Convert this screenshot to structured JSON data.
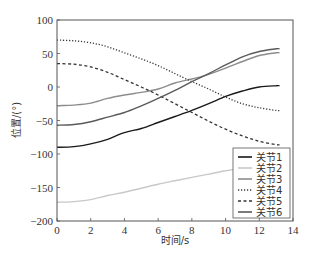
{
  "chart_data": {
    "type": "line",
    "title": "",
    "xlabel": "时间/s",
    "ylabel": "位置/(°)",
    "xlim": [
      0,
      14
    ],
    "ylim": [
      -200,
      100
    ],
    "xticks": [
      0,
      2,
      4,
      6,
      8,
      10,
      12,
      14
    ],
    "yticks": [
      100,
      50,
      0,
      -50,
      -100,
      -150,
      -200
    ],
    "grid": false,
    "legend_position": "lower right",
    "series": [
      {
        "name": "关节1",
        "style": "solid",
        "color": "#1a1a1a",
        "x": [
          0,
          1,
          2,
          3,
          4,
          5,
          6,
          7,
          8,
          9,
          10,
          11,
          12,
          13,
          13.2
        ],
        "values": [
          -90,
          -89,
          -85,
          -78,
          -68,
          -62,
          -53,
          -44,
          -35,
          -25,
          -14,
          -6,
          0,
          2,
          2
        ]
      },
      {
        "name": "关节2",
        "style": "solid",
        "color": "#c8c8c8",
        "x": [
          0,
          1,
          2,
          3,
          4,
          5,
          6,
          7,
          8,
          9,
          10,
          10.5
        ],
        "values": [
          -172,
          -171,
          -168,
          -162,
          -157,
          -151,
          -145,
          -140,
          -135,
          -130,
          -125,
          -123
        ]
      },
      {
        "name": "关节3",
        "style": "solid",
        "color": "#8c8c8c",
        "x": [
          0,
          1,
          2,
          3,
          4,
          5,
          6,
          7,
          8,
          9,
          10,
          11,
          12,
          13,
          13.2
        ],
        "values": [
          -28,
          -27,
          -24,
          -17,
          -12,
          -8,
          -3,
          6,
          12,
          19,
          28,
          38,
          47,
          51,
          51
        ]
      },
      {
        "name": "关节4",
        "style": "dotted",
        "color": "#333333",
        "x": [
          0,
          1,
          2,
          3,
          4,
          5,
          6,
          7,
          8,
          9,
          10,
          11,
          12,
          13,
          13.2
        ],
        "values": [
          70,
          69,
          66,
          60,
          51,
          42,
          32,
          20,
          8,
          -3,
          -15,
          -25,
          -31,
          -35,
          -35
        ]
      },
      {
        "name": "关节5",
        "style": "dashed",
        "color": "#333333",
        "x": [
          0,
          1,
          2,
          3,
          4,
          5,
          6,
          7,
          8,
          9,
          10,
          11,
          12,
          13,
          13.2
        ],
        "values": [
          35,
          34,
          30,
          22,
          11,
          0,
          -12,
          -25,
          -38,
          -51,
          -63,
          -73,
          -81,
          -86,
          -86
        ]
      },
      {
        "name": "关节6",
        "style": "solid",
        "color": "#5a5a5a",
        "x": [
          0,
          1,
          2,
          3,
          4,
          5,
          6,
          7,
          8,
          9,
          10,
          11,
          12,
          13,
          13.2
        ],
        "values": [
          -57,
          -56,
          -52,
          -45,
          -38,
          -28,
          -17,
          -5,
          8,
          20,
          33,
          45,
          53,
          57,
          57
        ]
      }
    ]
  },
  "legend": {
    "items": [
      "关节1",
      "关节2",
      "关节3",
      "关节4",
      "关节5",
      "关节6"
    ]
  }
}
